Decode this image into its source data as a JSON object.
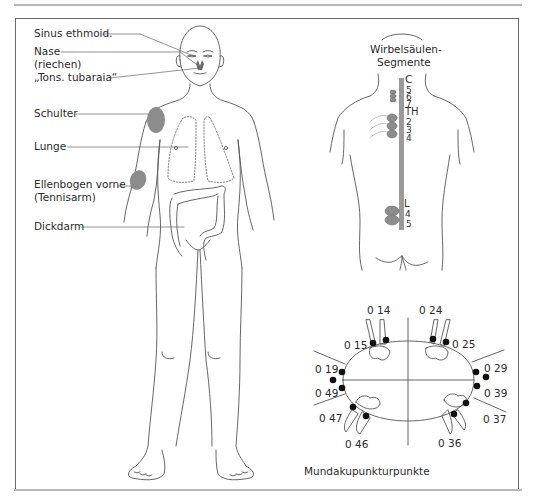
{
  "figure": {
    "front_labels": {
      "sinus": "Sinus ethmoid.",
      "nase_1": "Nase",
      "nase_2": "(riechen)",
      "tons": "„Tons. tubaraia“",
      "schulter": "Schulter",
      "lunge": "Lunge",
      "ellenbogen_1": "Ellenbogen vorne",
      "ellenbogen_2": "(Tennisarm)",
      "dickdarm": "Dickdarm"
    },
    "spine": {
      "title_1": "Wirbelsäulen-",
      "title_2": "Segmente",
      "segments": {
        "c": "C",
        "c5": "5",
        "c6": "6",
        "c7": "7",
        "th": "TH",
        "th2": "2",
        "th3": "3",
        "th4": "4",
        "l": "L",
        "l4": "4",
        "l5": "5"
      }
    },
    "mouth": {
      "caption": "Mundakupunkturpunkte",
      "points": {
        "p14": "0  14",
        "p15": "0  15",
        "p24": "0  24",
        "p25": "0 25",
        "p19": "0 19",
        "p49": "0 49",
        "p29": "0 29",
        "p39": "0 39",
        "p47": "0 47",
        "p46": "0  46",
        "p37": "0  37",
        "p36": "0 36"
      }
    },
    "colors": {
      "line": "#555555",
      "highlight": "#8c8c8c",
      "spine": "#9a9a9a",
      "dot": "#111111",
      "frame": "#6a6a6a",
      "rule": "#b8b8b8"
    }
  }
}
